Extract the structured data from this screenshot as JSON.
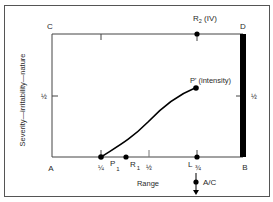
{
  "diagram": {
    "corners": {
      "top_left": "C",
      "top_right": "D",
      "bottom_left": "A",
      "bottom_right": "B"
    },
    "y_axis_label": "Severity—irritability—nature",
    "x_axis_label": "Range",
    "left_half_label": "½",
    "right_half_label": "½",
    "x_ticks": {
      "quarter": "¼",
      "half": "½",
      "three_quarter": "¾"
    },
    "points": {
      "p1": {
        "label": "P",
        "sub": "1"
      },
      "r1": {
        "label": "R",
        "sub": "1"
      },
      "l": {
        "label": "L"
      },
      "r2": {
        "label": "R",
        "sub": "2",
        "suffix": " (IV)"
      },
      "p_prime": {
        "label": "P'",
        "suffix": " (intensity)"
      }
    },
    "ac_marker": {
      "label": "A/C"
    },
    "colors": {
      "line": "#3a3a3a",
      "bar": "#000000",
      "frame": "#555555"
    }
  }
}
